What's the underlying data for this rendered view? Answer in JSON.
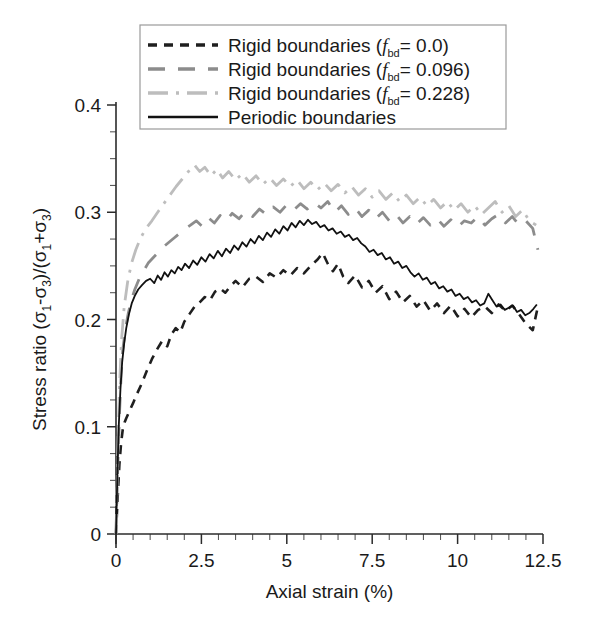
{
  "chart_data": {
    "type": "line",
    "title": "",
    "xlabel": "Axial strain (%)",
    "ylabel": "Stress ratio (σ₁-σ₃)/(σ₁+σ₃)",
    "xlim": [
      0,
      12.5
    ],
    "ylim": [
      0,
      0.4
    ],
    "xticks": [
      0,
      2.5,
      5,
      7.5,
      10,
      12.5
    ],
    "xticklabels": [
      "0",
      "2.5",
      "5",
      "7.5",
      "10",
      "12.5"
    ],
    "yticks": [
      0,
      0.1,
      0.2,
      0.3,
      0.4
    ],
    "yticklabels": [
      "0",
      "0.1",
      "0.2",
      "0.3",
      "0.4"
    ],
    "x_minor_step": 0.5,
    "y_minor_step": 0.025,
    "grid": false,
    "legend_position": "top-left-inside",
    "series": [
      {
        "name": "Rigid boundaries (f_bd= 0.0)",
        "label_prefix": "Rigid boundaries (",
        "label_symbol": "f",
        "label_subscript": "bd",
        "label_suffix": "= 0.0)",
        "color": "#1f1f1f",
        "dash": "dashed",
        "dasharray": "9,7",
        "width": 2.6,
        "x": [
          0.0,
          0.05,
          0.1,
          0.15,
          0.2,
          0.25,
          0.3,
          0.4,
          0.5,
          0.62,
          0.75,
          0.9,
          1.05,
          1.2,
          1.35,
          1.5,
          1.62,
          1.75,
          1.88,
          2.0,
          2.15,
          2.3,
          2.45,
          2.6,
          2.75,
          2.9,
          3.05,
          3.2,
          3.35,
          3.5,
          3.7,
          3.9,
          4.1,
          4.3,
          4.5,
          4.7,
          4.9,
          5.1,
          5.3,
          5.5,
          5.7,
          5.9,
          6.05,
          6.2,
          6.35,
          6.5,
          6.65,
          6.8,
          7.0,
          7.2,
          7.4,
          7.6,
          7.8,
          8.0,
          8.2,
          8.4,
          8.6,
          8.8,
          9.0,
          9.2,
          9.4,
          9.6,
          9.8,
          10.0,
          10.2,
          10.4,
          10.6,
          10.8,
          11.0,
          11.2,
          11.4,
          11.6,
          11.8,
          12.0,
          12.2,
          12.35
        ],
        "y": [
          0.0,
          0.035,
          0.065,
          0.085,
          0.098,
          0.104,
          0.108,
          0.115,
          0.122,
          0.131,
          0.14,
          0.152,
          0.163,
          0.172,
          0.18,
          0.175,
          0.186,
          0.192,
          0.188,
          0.198,
          0.205,
          0.212,
          0.216,
          0.221,
          0.218,
          0.226,
          0.229,
          0.225,
          0.231,
          0.236,
          0.23,
          0.238,
          0.24,
          0.235,
          0.243,
          0.239,
          0.246,
          0.241,
          0.248,
          0.243,
          0.25,
          0.256,
          0.262,
          0.252,
          0.245,
          0.252,
          0.24,
          0.234,
          0.241,
          0.23,
          0.236,
          0.225,
          0.231,
          0.219,
          0.226,
          0.216,
          0.222,
          0.212,
          0.218,
          0.208,
          0.215,
          0.206,
          0.213,
          0.203,
          0.21,
          0.202,
          0.209,
          0.212,
          0.206,
          0.214,
          0.208,
          0.213,
          0.205,
          0.196,
          0.19,
          0.212
        ]
      },
      {
        "name": "Rigid boundaries (f_bd= 0.096)",
        "label_prefix": "Rigid boundaries (",
        "label_symbol": "f",
        "label_subscript": "bd",
        "label_suffix": "= 0.096)",
        "color": "#8c8c8c",
        "dash": "long-dashed",
        "dasharray": "17,13",
        "width": 2.8,
        "x": [
          0.0,
          0.05,
          0.1,
          0.15,
          0.2,
          0.28,
          0.36,
          0.45,
          0.55,
          0.68,
          0.82,
          0.95,
          1.1,
          1.25,
          1.4,
          1.55,
          1.7,
          1.85,
          2.0,
          2.18,
          2.35,
          2.52,
          2.7,
          2.88,
          3.05,
          3.22,
          3.4,
          3.6,
          3.8,
          4.0,
          4.2,
          4.4,
          4.6,
          4.8,
          5.0,
          5.2,
          5.4,
          5.6,
          5.8,
          6.0,
          6.2,
          6.4,
          6.6,
          6.8,
          7.0,
          7.2,
          7.4,
          7.6,
          7.8,
          8.0,
          8.2,
          8.4,
          8.6,
          8.8,
          9.0,
          9.2,
          9.4,
          9.6,
          9.8,
          10.0,
          10.2,
          10.4,
          10.6,
          10.8,
          11.0,
          11.2,
          11.4,
          11.6,
          11.8,
          12.0,
          12.2,
          12.35
        ],
        "y": [
          0.0,
          0.06,
          0.11,
          0.148,
          0.172,
          0.192,
          0.206,
          0.218,
          0.228,
          0.238,
          0.246,
          0.253,
          0.258,
          0.263,
          0.268,
          0.272,
          0.276,
          0.28,
          0.284,
          0.288,
          0.292,
          0.287,
          0.295,
          0.29,
          0.297,
          0.292,
          0.299,
          0.294,
          0.301,
          0.296,
          0.303,
          0.298,
          0.305,
          0.3,
          0.307,
          0.302,
          0.308,
          0.303,
          0.309,
          0.304,
          0.31,
          0.3,
          0.306,
          0.298,
          0.304,
          0.296,
          0.302,
          0.294,
          0.3,
          0.292,
          0.298,
          0.29,
          0.296,
          0.289,
          0.295,
          0.288,
          0.294,
          0.287,
          0.293,
          0.286,
          0.292,
          0.29,
          0.296,
          0.288,
          0.294,
          0.298,
          0.29,
          0.296,
          0.288,
          0.292,
          0.285,
          0.265
        ]
      },
      {
        "name": "Rigid boundaries (f_bd= 0.228)",
        "label_prefix": "Rigid boundaries (",
        "label_symbol": "f",
        "label_subscript": "bd",
        "label_suffix": "= 0.228)",
        "color": "#bdbdbd",
        "dash": "dash-dot",
        "dasharray": "20,8,3,8",
        "width": 2.8,
        "x": [
          0.0,
          0.05,
          0.1,
          0.16,
          0.24,
          0.34,
          0.45,
          0.58,
          0.72,
          0.88,
          1.05,
          1.22,
          1.4,
          1.58,
          1.76,
          1.94,
          2.12,
          2.3,
          2.45,
          2.6,
          2.78,
          2.95,
          3.12,
          3.3,
          3.5,
          3.7,
          3.9,
          4.1,
          4.3,
          4.5,
          4.7,
          4.9,
          5.1,
          5.3,
          5.5,
          5.7,
          5.9,
          6.1,
          6.3,
          6.5,
          6.7,
          6.9,
          7.1,
          7.3,
          7.5,
          7.7,
          7.9,
          8.1,
          8.3,
          8.5,
          8.7,
          8.9,
          9.1,
          9.3,
          9.5,
          9.7,
          9.9,
          10.1,
          10.3,
          10.5,
          10.7,
          10.9,
          11.1,
          11.3,
          11.5,
          11.7,
          11.9,
          12.1,
          12.3
        ],
        "y": [
          0.0,
          0.072,
          0.135,
          0.18,
          0.212,
          0.235,
          0.252,
          0.265,
          0.276,
          0.285,
          0.292,
          0.3,
          0.308,
          0.316,
          0.324,
          0.331,
          0.338,
          0.344,
          0.338,
          0.342,
          0.334,
          0.34,
          0.332,
          0.338,
          0.33,
          0.336,
          0.328,
          0.334,
          0.326,
          0.332,
          0.325,
          0.331,
          0.324,
          0.33,
          0.322,
          0.328,
          0.321,
          0.327,
          0.32,
          0.326,
          0.318,
          0.324,
          0.316,
          0.322,
          0.314,
          0.32,
          0.312,
          0.318,
          0.31,
          0.316,
          0.308,
          0.314,
          0.306,
          0.312,
          0.304,
          0.31,
          0.302,
          0.308,
          0.3,
          0.306,
          0.298,
          0.304,
          0.31,
          0.3,
          0.306,
          0.296,
          0.302,
          0.292,
          0.288
        ]
      },
      {
        "name": "Periodic boundaries",
        "label_prefix": "Periodic boundaries",
        "label_symbol": "",
        "label_subscript": "",
        "label_suffix": "",
        "color": "#111111",
        "dash": "solid",
        "dasharray": "",
        "width": 1.8,
        "x": [
          0.0,
          0.04,
          0.08,
          0.13,
          0.18,
          0.24,
          0.3,
          0.38,
          0.46,
          0.55,
          0.65,
          0.76,
          0.88,
          1.0,
          1.12,
          1.22,
          1.32,
          1.42,
          1.52,
          1.62,
          1.72,
          1.82,
          1.92,
          2.02,
          2.14,
          2.26,
          2.38,
          2.5,
          2.62,
          2.74,
          2.86,
          2.98,
          3.1,
          3.22,
          3.34,
          3.46,
          3.58,
          3.7,
          3.82,
          3.94,
          4.06,
          4.18,
          4.3,
          4.42,
          4.54,
          4.66,
          4.78,
          4.9,
          5.02,
          5.14,
          5.26,
          5.38,
          5.5,
          5.62,
          5.74,
          5.86,
          5.98,
          6.1,
          6.22,
          6.34,
          6.46,
          6.58,
          6.7,
          6.82,
          6.94,
          7.06,
          7.18,
          7.3,
          7.42,
          7.54,
          7.66,
          7.78,
          7.9,
          8.02,
          8.14,
          8.26,
          8.38,
          8.5,
          8.62,
          8.74,
          8.86,
          8.98,
          9.1,
          9.22,
          9.34,
          9.46,
          9.58,
          9.7,
          9.82,
          9.94,
          10.06,
          10.18,
          10.3,
          10.42,
          10.54,
          10.66,
          10.78,
          10.9,
          11.02,
          11.14,
          11.26,
          11.38,
          11.5,
          11.62,
          11.74,
          11.86,
          11.98,
          12.1,
          12.22,
          12.32
        ],
        "y": [
          0.0,
          0.055,
          0.1,
          0.135,
          0.16,
          0.178,
          0.192,
          0.205,
          0.215,
          0.222,
          0.228,
          0.232,
          0.236,
          0.238,
          0.234,
          0.241,
          0.237,
          0.244,
          0.24,
          0.246,
          0.243,
          0.249,
          0.246,
          0.252,
          0.248,
          0.255,
          0.251,
          0.258,
          0.254,
          0.261,
          0.257,
          0.264,
          0.259,
          0.266,
          0.262,
          0.269,
          0.265,
          0.272,
          0.268,
          0.275,
          0.271,
          0.278,
          0.274,
          0.281,
          0.277,
          0.284,
          0.28,
          0.287,
          0.283,
          0.29,
          0.286,
          0.292,
          0.288,
          0.293,
          0.289,
          0.291,
          0.286,
          0.288,
          0.283,
          0.285,
          0.28,
          0.282,
          0.277,
          0.279,
          0.274,
          0.276,
          0.271,
          0.268,
          0.263,
          0.265,
          0.26,
          0.262,
          0.256,
          0.258,
          0.252,
          0.254,
          0.248,
          0.25,
          0.244,
          0.24,
          0.243,
          0.237,
          0.239,
          0.233,
          0.235,
          0.229,
          0.231,
          0.226,
          0.228,
          0.222,
          0.224,
          0.219,
          0.221,
          0.216,
          0.218,
          0.213,
          0.215,
          0.224,
          0.218,
          0.212,
          0.214,
          0.209,
          0.211,
          0.213,
          0.207,
          0.209,
          0.204,
          0.206,
          0.21,
          0.214
        ]
      }
    ]
  }
}
